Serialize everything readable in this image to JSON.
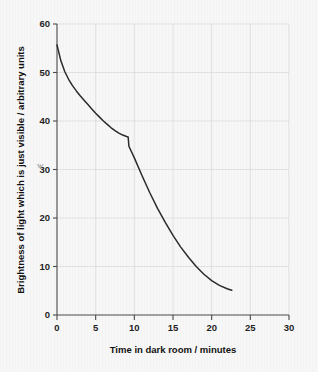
{
  "figure": {
    "cut_off_caption": "",
    "background_color": "#f7f7f7",
    "curve_color": "#2b2b2b",
    "axis_color": "#4a4a4a",
    "grid_color": "#d9d9d9",
    "annotation_smudge": "w"
  },
  "chart_data": {
    "type": "line",
    "title": "",
    "xlabel": "Time in dark room / minutes",
    "ylabel": "Brightness of light which is just visible / arbitrary units",
    "xlim": [
      0,
      30
    ],
    "ylim": [
      0,
      60
    ],
    "xticks": [
      0,
      5,
      10,
      15,
      20,
      25,
      30
    ],
    "yticks": [
      0,
      10,
      20,
      30,
      40,
      50,
      60
    ],
    "xtick_labels": [
      "0",
      "5",
      "10",
      "15",
      "20",
      "25",
      "30"
    ],
    "ytick_labels": [
      "0",
      "10",
      "20",
      "30",
      "40",
      "50",
      "60"
    ],
    "grid": true,
    "legend": null,
    "series": [
      {
        "name": "Dark adaptation curve",
        "x": [
          0.0,
          0.5,
          1.0,
          1.5,
          2.0,
          2.5,
          3.0,
          3.5,
          4.0,
          4.5,
          5.0,
          5.5,
          6.0,
          6.5,
          7.0,
          7.5,
          8.0,
          8.5,
          9.0,
          9.2,
          9.3,
          10.0,
          11.0,
          12.0,
          13.0,
          14.0,
          15.0,
          16.0,
          17.0,
          18.0,
          19.0,
          20.0,
          21.0,
          22.0,
          22.6
        ],
        "y": [
          55.7,
          52.4,
          50.2,
          48.6,
          47.3,
          46.2,
          45.2,
          44.3,
          43.4,
          42.5,
          41.6,
          40.8,
          40.0,
          39.3,
          38.6,
          38.0,
          37.5,
          37.1,
          36.8,
          36.7,
          34.8,
          32.4,
          28.7,
          25.2,
          22.0,
          19.1,
          16.4,
          14.0,
          11.9,
          10.0,
          8.4,
          7.1,
          6.1,
          5.4,
          5.1
        ],
        "annotations": [
          {
            "label": "rod-cone break",
            "x": 9.2,
            "y": 36.7
          }
        ]
      }
    ]
  }
}
